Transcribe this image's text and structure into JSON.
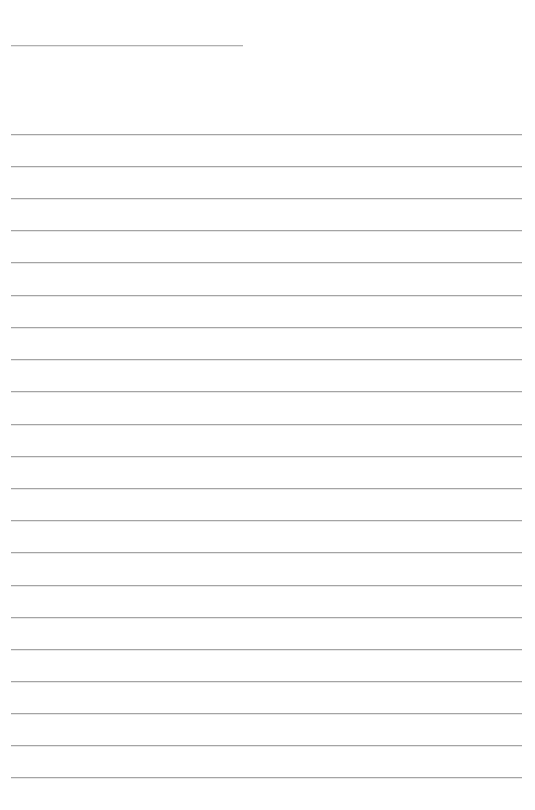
{
  "page": {
    "kind": "lined-paper-template",
    "width": 535,
    "height": 810,
    "background_color": "#ffffff",
    "text_content": "",
    "notes_visible_text": ""
  },
  "rules": {
    "color": "#a4a4a4",
    "thickness_px": 1,
    "left_margin_px": 11,
    "right_edge_px": 522,
    "title_rule": {
      "y": 45,
      "x_start": 11,
      "x_end": 243,
      "color": "#b0b0b0"
    },
    "body_rules": {
      "count": 21,
      "first_y": 134,
      "spacing_px": 32.1,
      "x_start": 11,
      "x_end": 522,
      "y_positions": [
        134,
        166,
        198,
        230,
        262,
        295,
        327,
        359,
        391,
        424,
        456,
        488,
        520,
        552,
        585,
        617,
        649,
        681,
        713,
        745,
        777
      ]
    }
  }
}
